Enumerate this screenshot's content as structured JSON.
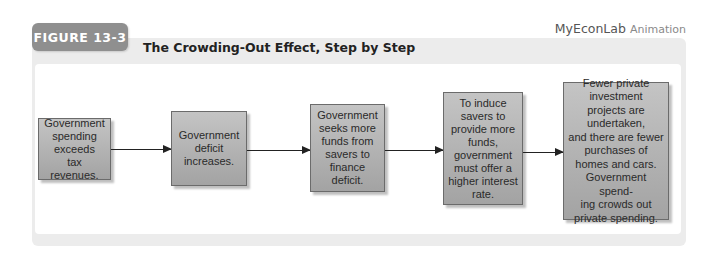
{
  "figure": {
    "badge": "FIGURE 13-3",
    "title": "The Crowding-Out Effect, Step by Step",
    "brand": "MyEconLab",
    "brand_sub": "Animation"
  },
  "steps": [
    {
      "text": "Government\nspending\nexceeds\ntax revenues."
    },
    {
      "text": "Government\ndeficit\nincreases."
    },
    {
      "text": "Government\nseeks more\nfunds from\nsavers to\nfinance deficit."
    },
    {
      "text": "To induce\nsavers to\nprovide more\nfunds,\ngovernment\nmust offer a\nhigher interest\nrate."
    },
    {
      "text": "Fewer private\ninvestment\nprojects are\nundertaken,\nand there are fewer\npurchases of\nhomes and cars.\nGovernment spend-\ning crowds out\nprivate spending."
    }
  ],
  "colors": {
    "box_fill_top": "#c4c4c4",
    "box_fill_bottom": "#a3a3a3",
    "badge": "#8f8f8f",
    "frame": "#ececec"
  }
}
